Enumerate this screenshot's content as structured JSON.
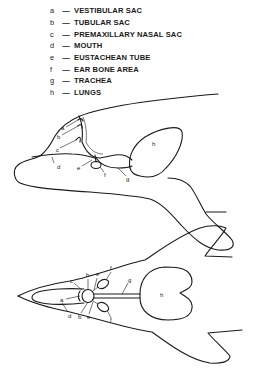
{
  "legend": {
    "items": [
      {
        "key": "a",
        "label": "VESTIBULAR SAC"
      },
      {
        "key": "b",
        "label": "TUBULAR SAC"
      },
      {
        "key": "c",
        "label": "PREMAXILLARY NASAL SAC"
      },
      {
        "key": "d",
        "label": "MOUTH"
      },
      {
        "key": "e",
        "label": "EUSTACHEAN TUBE"
      },
      {
        "key": "f",
        "label": "EAR BONE AREA"
      },
      {
        "key": "g",
        "label": "TRACHEA"
      },
      {
        "key": "h",
        "label": "LUNGS"
      }
    ],
    "dash": "—"
  },
  "side_view": {
    "labels": {
      "a": "a",
      "b": "b",
      "c": "c",
      "d": "d",
      "e": "e",
      "f": "f",
      "g": "g",
      "h": "h"
    }
  },
  "top_view": {
    "labels": {
      "a": "a",
      "b1": "b",
      "b2": "b",
      "c": "c",
      "d": "d",
      "e1": "e",
      "e2": "e",
      "f1": "f",
      "f2": "f",
      "g": "g",
      "h": "h"
    }
  },
  "colors": {
    "ink": "#1a1a1a",
    "background": "#ffffff"
  }
}
